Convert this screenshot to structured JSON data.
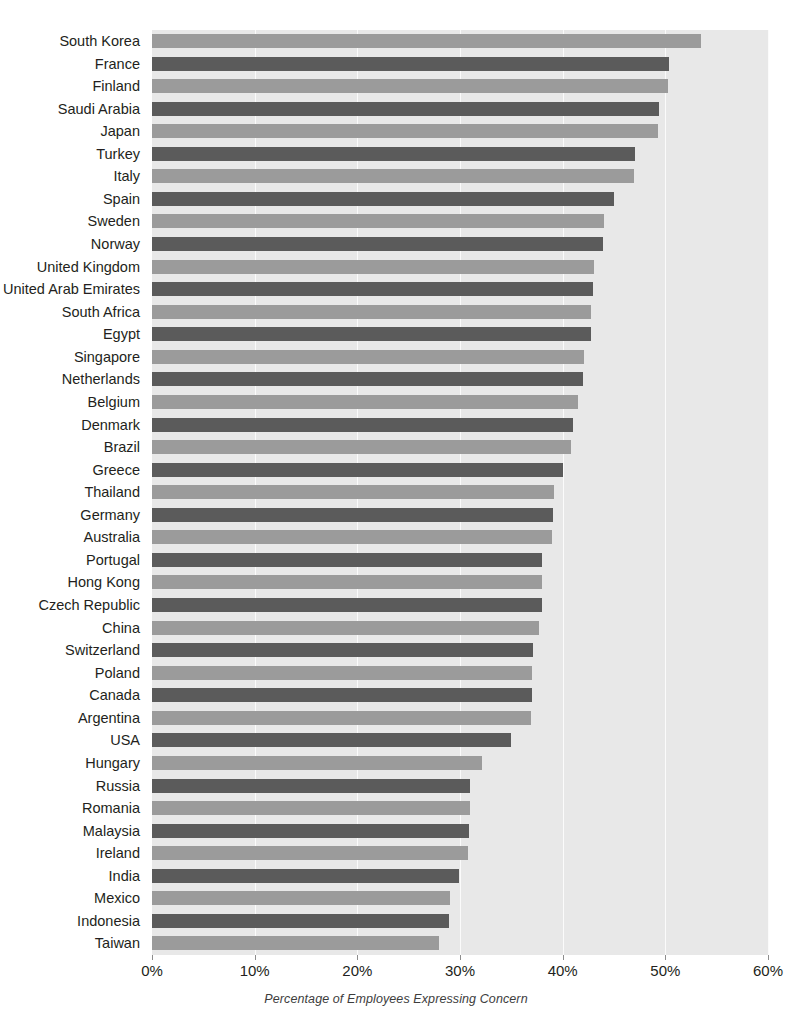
{
  "chart_data": {
    "type": "bar",
    "orientation": "horizontal",
    "title": "",
    "subtitle": "",
    "xlabel": "Percentage of Employees Expressing Concern",
    "ylabel": "",
    "xlim": [
      0,
      60
    ],
    "xtick_labels": [
      "0%",
      "10%",
      "20%",
      "30%",
      "40%",
      "50%",
      "60%"
    ],
    "xticks": [
      0,
      10,
      20,
      30,
      40,
      50,
      60
    ],
    "grid": true,
    "grid_axis": "x",
    "legend": null,
    "value_unit": "%",
    "colors": {
      "bar_light": "#9b9b9b",
      "bar_dark": "#5b5b5b",
      "plot_background": "#e8e8e8",
      "gridline": "#fbfbfb",
      "text": "#231f20"
    },
    "categories": [
      "South Korea",
      "France",
      "Finland",
      "Saudi Arabia",
      "Japan",
      "Turkey",
      "Italy",
      "Spain",
      "Sweden",
      "Norway",
      "United Kingdom",
      "United Arab Emirates",
      "South Africa",
      "Egypt",
      "Singapore",
      "Netherlands",
      "Belgium",
      "Denmark",
      "Brazil",
      "Greece",
      "Thailand",
      "Germany",
      "Australia",
      "Portugal",
      "Hong Kong",
      "Czech Republic",
      "China",
      "Switzerland",
      "Poland",
      "Canada",
      "Argentina",
      "USA",
      "Hungary",
      "Russia",
      "Romania",
      "Malaysia",
      "Ireland",
      "India",
      "Mexico",
      "Indonesia",
      "Taiwan"
    ],
    "values": [
      53.5,
      50.4,
      50.3,
      49.4,
      49.3,
      47.0,
      46.9,
      45.0,
      44.0,
      43.9,
      43.1,
      43.0,
      42.8,
      42.8,
      42.1,
      42.0,
      41.5,
      41.0,
      40.8,
      40.0,
      39.2,
      39.1,
      39.0,
      38.0,
      38.0,
      38.0,
      37.7,
      37.1,
      37.0,
      37.0,
      36.9,
      35.0,
      32.1,
      31.0,
      31.0,
      30.9,
      30.8,
      29.9,
      29.0,
      28.9,
      28.0
    ],
    "bar_shades": [
      "light",
      "dark",
      "light",
      "dark",
      "light",
      "dark",
      "light",
      "dark",
      "light",
      "dark",
      "light",
      "dark",
      "light",
      "dark",
      "light",
      "dark",
      "light",
      "dark",
      "light",
      "dark",
      "light",
      "dark",
      "light",
      "dark",
      "light",
      "dark",
      "light",
      "dark",
      "light",
      "dark",
      "light",
      "dark",
      "light",
      "dark",
      "light",
      "dark",
      "light",
      "dark",
      "light",
      "dark",
      "light"
    ]
  }
}
